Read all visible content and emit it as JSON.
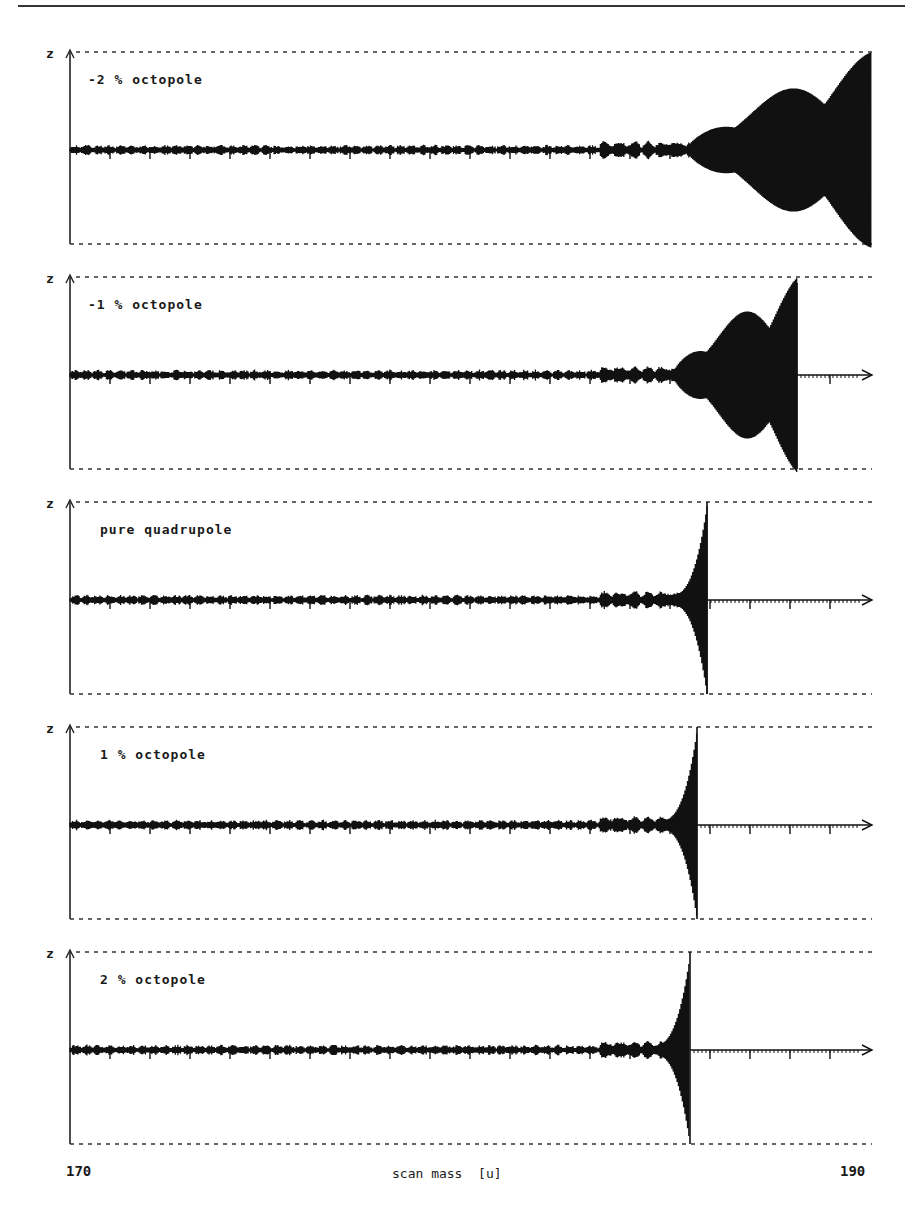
{
  "chart_data": {
    "type": "line",
    "title": "",
    "xlabel": "scan mass  [u]",
    "ylabel": "z",
    "x_range": [
      170,
      190
    ],
    "x_tick_labels": [
      "170",
      "190"
    ],
    "y_bounds": "dashed lines mark electrode boundary (±r0)",
    "grid": false,
    "legend": null,
    "panels": [
      {
        "label": "-2 % octopole",
        "ejection_mass": null,
        "instability_onset": 183.8,
        "note": "trajectory amplitude grows with beats, reaches boundary at end of scan (~190)"
      },
      {
        "label": "-1 % octopole",
        "ejection_mass": 188.1,
        "instability_onset": 184.0,
        "note": "large beating envelope, ejected ~188"
      },
      {
        "label": "pure quadrupole",
        "ejection_mass": 185.8,
        "instability_onset": 184.9,
        "note": "sharp exponential growth, ejected ~185.8"
      },
      {
        "label": "1 % octopole",
        "ejection_mass": 185.5,
        "instability_onset": 184.9,
        "note": "sharp growth, ejected ~185.5"
      },
      {
        "label": "2 % octopole",
        "ejection_mass": 185.3,
        "instability_onset": 184.9,
        "note": "sharp growth, ejected ~185.3"
      }
    ]
  },
  "axis": {
    "z_label": "z",
    "x_min_label": "170",
    "x_max_label": "190",
    "x_title": "scan mass  [u]"
  },
  "panels": [
    {
      "label": "-2 % octopole"
    },
    {
      "label": "-1 % octopole"
    },
    {
      "label": "pure quadrupole"
    },
    {
      "label": "1 % octopole"
    },
    {
      "label": "2 % octopole"
    }
  ]
}
